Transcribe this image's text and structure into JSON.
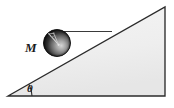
{
  "figure": {
    "background_color": "#ffffff",
    "labels": {
      "mass": "M",
      "angle": "θ"
    },
    "colors": {
      "incline_fill": "#efefef",
      "incline_stroke": "#2b2b2b",
      "ball_dark": "#1c1c1c",
      "ball_mid": "#6e6e6e",
      "ball_light": "#cfcfcf",
      "guide_line": "#3a3a3a",
      "label_color": "#1a1a1a"
    },
    "geometry": {
      "triangle_vertices": [
        [
          8,
          96
        ],
        [
          165,
          96
        ],
        [
          165,
          7
        ]
      ],
      "ball_center": [
        57,
        43
      ],
      "ball_radius": 13.5,
      "guide_line": [
        [
          64,
          32
        ],
        [
          112,
          32
        ]
      ],
      "angle_arc_center": [
        8,
        96
      ],
      "angle_arc_radius": 24,
      "angle_degrees": 29
    },
    "elements": {
      "incline_name": "inclined-plane",
      "ball_name": "sphere-mass",
      "guide_name": "horizontal-guide-line",
      "arc_name": "angle-arc",
      "mass_label_name": "mass-label",
      "angle_label_name": "angle-label"
    }
  }
}
